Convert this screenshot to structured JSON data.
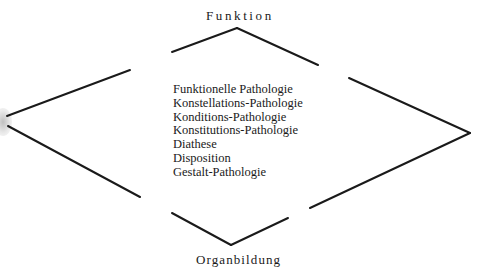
{
  "diagram": {
    "top_label": "Funktion",
    "bottom_label": "Organbildung",
    "terms": [
      "Funktionelle Pathologie",
      "Konstellations-Pathologie",
      "Konditions-Pathologie",
      "Konstitutions-Pathologie",
      "Diathese",
      "Disposition",
      "Gestalt-Pathologie"
    ],
    "line_color": "#1a1a1a",
    "segments": [
      {
        "name": "upper-left",
        "from": [
          7,
          116
        ],
        "to": [
          130,
          70
        ]
      },
      {
        "name": "lower-left",
        "from": [
          8,
          126
        ],
        "to": [
          140,
          197
        ]
      },
      {
        "name": "top-left",
        "from": [
          172,
          52
        ],
        "to": [
          237,
          28
        ]
      },
      {
        "name": "top-right",
        "from": [
          237,
          28
        ],
        "to": [
          318,
          65
        ]
      },
      {
        "name": "upper-right",
        "from": [
          349,
          78
        ],
        "to": [
          470,
          133
        ]
      },
      {
        "name": "lower-right",
        "from": [
          470,
          133
        ],
        "to": [
          310,
          208
        ]
      },
      {
        "name": "bottom-left",
        "from": [
          172,
          213
        ],
        "to": [
          231,
          245
        ]
      },
      {
        "name": "bottom-right",
        "from": [
          231,
          245
        ],
        "to": [
          288,
          218
        ]
      }
    ]
  }
}
